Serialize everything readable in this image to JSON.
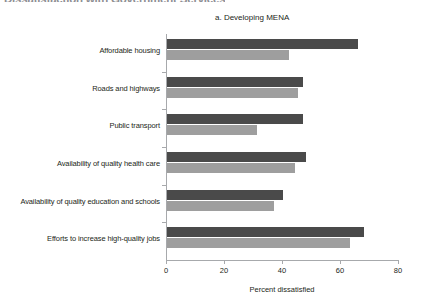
{
  "figure": {
    "title": "Dissatisfaction with Government Services",
    "panel_subtitle": "a. Developing MENA"
  },
  "colors": {
    "series_dark": "#4a4a4a",
    "series_light": "#9e9e9e",
    "axis": "#a7a9ac",
    "text": "#231f20"
  },
  "chart_data": {
    "type": "bar",
    "orientation": "horizontal",
    "title": "a. Developing MENA",
    "xlabel": "Percent dissatisfied",
    "ylabel": "",
    "xlim": [
      0,
      80
    ],
    "xticks": [
      0,
      20,
      40,
      60,
      80
    ],
    "grid": false,
    "legend": "none",
    "categories": [
      "Affordable housing",
      "Roads and highways",
      "Public transport",
      "Availability of quality health care",
      "Availability of quality education and schools",
      "Efforts to increase high-quality jobs"
    ],
    "series": [
      {
        "name": "series-dark",
        "values": [
          66,
          47,
          47,
          48,
          40,
          68
        ]
      },
      {
        "name": "series-light",
        "values": [
          42,
          45,
          31,
          44,
          37,
          63
        ]
      }
    ]
  }
}
